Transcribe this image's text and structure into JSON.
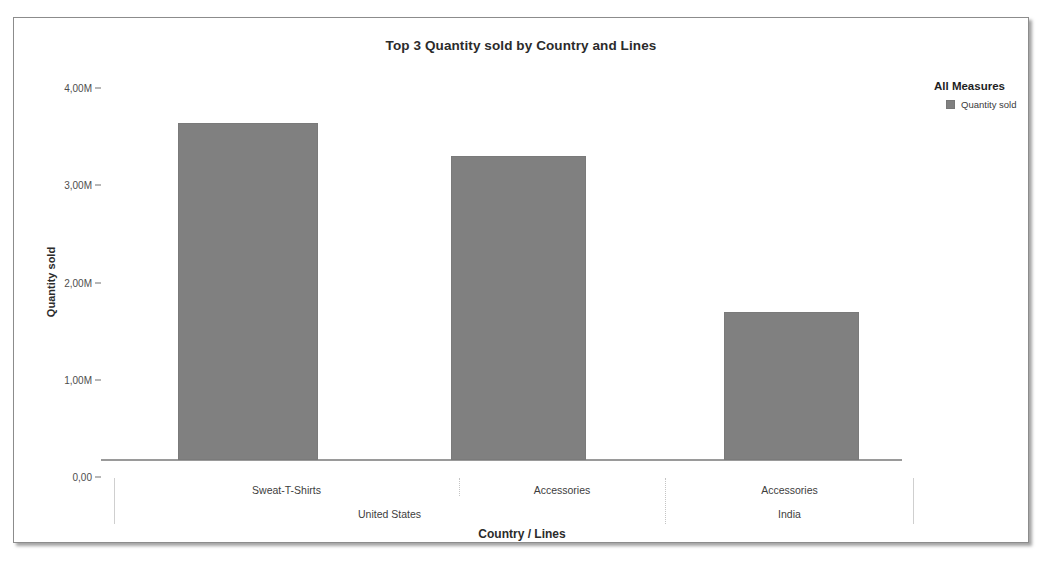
{
  "panel": {
    "title": "Top 3 Quantity sold by Country and Lines"
  },
  "legend": {
    "title": "All Measures",
    "items": [
      {
        "label": "Quantity sold",
        "color": "#808080",
        "swatch_name": "legend-swatch-quantity-sold"
      }
    ]
  },
  "axes": {
    "y_title": "Quantity sold",
    "x_title": "Country / Lines",
    "y_ticks": [
      {
        "label": "4,00M",
        "value": 4000000
      },
      {
        "label": "3,00M",
        "value": 3000000
      },
      {
        "label": "2,00M",
        "value": 2000000
      },
      {
        "label": "1,00M",
        "value": 1000000
      },
      {
        "label": "0,00",
        "value": 0
      }
    ]
  },
  "chart_data": {
    "type": "bar",
    "title": "Top 3 Quantity sold by Country and Lines",
    "xlabel": "Country / Lines",
    "ylabel": "Quantity sold",
    "ylim": [
      0,
      4000000
    ],
    "ytick_labels": [
      "0,00",
      "1,00M",
      "2,00M",
      "3,00M",
      "4,00M"
    ],
    "ytick_values": [
      0,
      1000000,
      2000000,
      3000000,
      4000000
    ],
    "grid": false,
    "legend_position": "top-right",
    "legend_title": "All Measures",
    "group_level_label": "Country",
    "category_level_label": "Lines",
    "groups": [
      {
        "name": "United States",
        "categories": [
          "Sweat-T-Shirts",
          "Accessories"
        ]
      },
      {
        "name": "India",
        "categories": [
          "Accessories"
        ]
      }
    ],
    "categories": [
      "Sweat-T-Shirts",
      "Accessories",
      "Accessories"
    ],
    "series": [
      {
        "name": "Quantity sold",
        "color": "#808080",
        "values": [
          3470000,
          3130000,
          1520000
        ]
      }
    ],
    "points": [
      {
        "country": "United States",
        "line": "Sweat-T-Shirts",
        "measure": "Quantity sold",
        "value": 3470000,
        "value_label": "3,47M"
      },
      {
        "country": "United States",
        "line": "Accessories",
        "measure": "Quantity sold",
        "value": 3130000,
        "value_label": "3,13M"
      },
      {
        "country": "India",
        "line": "Accessories",
        "measure": "Quantity sold",
        "value": 1520000,
        "value_label": "1,52M"
      }
    ]
  }
}
